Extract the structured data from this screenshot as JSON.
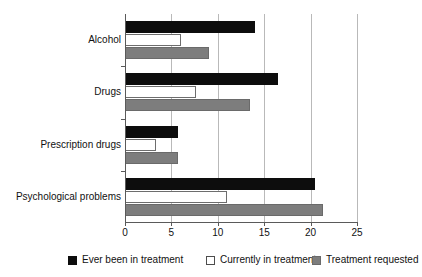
{
  "chart_data": {
    "type": "bar",
    "orientation": "horizontal",
    "title": "",
    "subtitle": "",
    "xlabel": "",
    "ylabel": "",
    "xlim": [
      0,
      25
    ],
    "ylim": null,
    "grid": true,
    "grid_axis": "x",
    "legend_position": "bottom",
    "categories": [
      "Alcohol",
      "Drugs",
      "Prescription drugs",
      "Psychological problems"
    ],
    "xticks": [
      "0",
      "5",
      "10",
      "15",
      "20",
      "25"
    ],
    "xtick_values": [
      0,
      5,
      10,
      15,
      20,
      25
    ],
    "series": [
      {
        "name": "Ever been in treatment",
        "color": "#0d0d0d",
        "values": [
          14.0,
          16.5,
          5.7,
          20.5
        ]
      },
      {
        "name": "Currently in treatment",
        "color": "#ffffff",
        "values": [
          6.0,
          7.7,
          3.3,
          11.0
        ]
      },
      {
        "name": "Treatment requested",
        "color": "#7d7d7d",
        "values": [
          9.0,
          13.5,
          5.7,
          21.3
        ]
      }
    ]
  },
  "legend": {
    "items": [
      {
        "label": "Ever been in treatment",
        "swatch": "black"
      },
      {
        "label": "Currently in treatment",
        "swatch": "white"
      },
      {
        "label": "Treatment requested",
        "swatch": "gray"
      }
    ]
  },
  "colors": {
    "bar_black": "#0d0d0d",
    "bar_white": "#ffffff",
    "bar_gray": "#7d7d7d",
    "axis": "#5a5a5a",
    "gridline": "#b9b9b9",
    "background": "#ffffff",
    "text": "#111111"
  }
}
